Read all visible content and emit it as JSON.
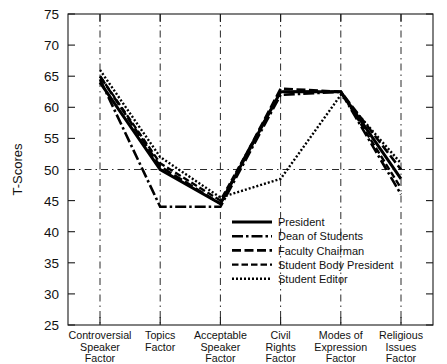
{
  "chart_data": {
    "type": "line",
    "title": "",
    "xlabel": "",
    "ylabel": "T-Scores",
    "ylim": [
      25,
      75
    ],
    "yticks": [
      25,
      30,
      35,
      40,
      45,
      50,
      55,
      60,
      65,
      70,
      75
    ],
    "grid": "vertical dash-dot gridlines at each category; horizontal dash-dot reference line at T-Score 50",
    "legend_position": "inside lower-center-right",
    "reference_line": 50,
    "categories": [
      "Controversial Speaker Factor",
      "Topics Factor",
      "Acceptable Speaker Factor",
      "Civil Rights Factor",
      "Modes of Expression Factor",
      "Religious Issues Factor"
    ],
    "category_lines": [
      [
        "Controversial",
        "Speaker",
        "Factor"
      ],
      [
        "Topics",
        "Factor"
      ],
      [
        "Acceptable",
        "Speaker",
        "Factor"
      ],
      [
        "Civil",
        "Rights",
        "Factor"
      ],
      [
        "Modes of",
        "Expression",
        "Factor"
      ],
      [
        "Religious",
        "Issues",
        "Factor"
      ]
    ],
    "series": [
      {
        "name": "President",
        "style": "solid",
        "dasharray": "none",
        "width": 3.0,
        "values": [
          64.0,
          50.0,
          44.5,
          62.5,
          62.5,
          48.5
        ]
      },
      {
        "name": "Dean of Students",
        "style": "dash-dot",
        "dasharray": "11 3 2.5 3",
        "width": 2.6,
        "values": [
          64.5,
          44.0,
          44.0,
          62.0,
          62.5,
          46.0
        ]
      },
      {
        "name": "Faculty Chairman",
        "style": "long-dash",
        "dasharray": "9 3.5",
        "width": 2.6,
        "values": [
          65.0,
          50.5,
          44.5,
          63.0,
          62.5,
          50.0
        ]
      },
      {
        "name": "Student Body President",
        "style": "dashed",
        "dasharray": "6.5 3",
        "width": 2.4,
        "values": [
          65.0,
          51.0,
          45.0,
          62.5,
          62.5,
          47.0
        ]
      },
      {
        "name": "Student Editor",
        "style": "dotted",
        "dasharray": "2 2",
        "width": 2.4,
        "values": [
          66.0,
          52.0,
          45.5,
          48.5,
          62.0,
          51.0
        ]
      }
    ]
  },
  "legend": {
    "items": [
      "President",
      "Dean of Students",
      "Faculty Chairman",
      "Student Body President",
      "Student Editor"
    ]
  },
  "axes": {
    "y_axis_label": "T-Scores",
    "y_tick_labels": [
      "25",
      "30",
      "35",
      "40",
      "45",
      "50",
      "55",
      "60",
      "65",
      "70",
      "75"
    ]
  }
}
